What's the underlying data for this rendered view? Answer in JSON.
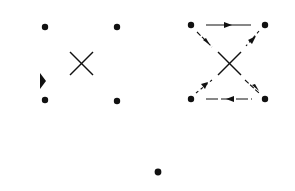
{
  "diagram": {
    "background": "#ffffff",
    "ink": "#111111",
    "panels": [
      {
        "id": "left",
        "nodes": [
          {
            "x": 45,
            "y": 27
          },
          {
            "x": 117,
            "y": 27
          },
          {
            "x": 45,
            "y": 100
          },
          {
            "x": 117,
            "y": 101
          }
        ],
        "cross": {
          "cx": 81,
          "cy": 63,
          "half": 12
        },
        "stray_arrowhead": {
          "x": 42,
          "y": 82,
          "direction": "right"
        }
      },
      {
        "id": "right",
        "nodes": [
          {
            "x": 191,
            "y": 25
          },
          {
            "x": 265,
            "y": 25
          },
          {
            "x": 191,
            "y": 99
          },
          {
            "x": 265,
            "y": 99
          }
        ],
        "cross": {
          "cx": 229,
          "cy": 63,
          "half": 12
        },
        "edges": [
          {
            "from": 0,
            "to": 1,
            "style": "solid",
            "arrow": "right"
          },
          {
            "from": 0,
            "to": "center",
            "style": "dashed",
            "arrow": "down-right"
          },
          {
            "from": 1,
            "to": "center",
            "style": "dashed",
            "arrow": "down-left"
          },
          {
            "from": 2,
            "to": "center",
            "style": "dashed",
            "arrow": "up-right"
          },
          {
            "from": 3,
            "to": "center",
            "style": "dashed",
            "arrow": "up-left"
          },
          {
            "from": 3,
            "to": 2,
            "style": "dashed",
            "arrow": "left"
          }
        ]
      }
    ],
    "isolated_node": {
      "x": 158,
      "y": 172
    }
  }
}
